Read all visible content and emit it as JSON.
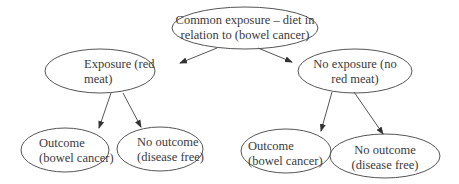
{
  "diagram": {
    "type": "tree",
    "nodes": [
      {
        "id": "root",
        "line1": "Common exposure – diet in",
        "line2": "relation to (bowel cancer)"
      },
      {
        "id": "exposure",
        "line1": "Exposure (red",
        "line2": "meat)"
      },
      {
        "id": "no_exposure",
        "line1": "No exposure  (no",
        "line2": "red meat)"
      },
      {
        "id": "exp_outcome",
        "line1": "Outcome",
        "line2": "(bowel cancer)"
      },
      {
        "id": "exp_no_outcome",
        "line1": "No outcome",
        "line2": "(disease free)"
      },
      {
        "id": "noexp_outcome",
        "line1": "Outcome",
        "line2": "(bowel cancer)"
      },
      {
        "id": "noexp_no_outcome",
        "line1": "No outcome",
        "line2": "(disease free)"
      }
    ],
    "edges": [
      {
        "from": "root",
        "to": "exposure"
      },
      {
        "from": "root",
        "to": "no_exposure"
      },
      {
        "from": "exposure",
        "to": "exp_outcome"
      },
      {
        "from": "exposure",
        "to": "exp_no_outcome"
      },
      {
        "from": "no_exposure",
        "to": "noexp_outcome"
      },
      {
        "from": "no_exposure",
        "to": "noexp_no_outcome"
      }
    ],
    "colors": {
      "stroke": "#555555",
      "text": "#3a3a3a",
      "background": "#ffffff"
    }
  }
}
